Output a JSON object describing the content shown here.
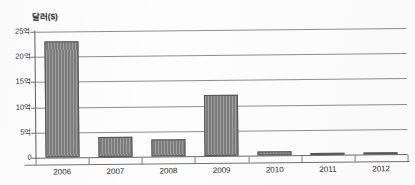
{
  "chart_data": {
    "type": "bar",
    "title": "",
    "ylabel": "달러($)",
    "xlabel": "",
    "categories": [
      "2006",
      "2007",
      "2008",
      "2009",
      "2010",
      "2011",
      "2012"
    ],
    "values": [
      23.0,
      4.0,
      3.3,
      12.1,
      0.7,
      0.2,
      0.1
    ],
    "unit": "억",
    "ylim": [
      0,
      25
    ],
    "yticks": [
      0,
      5,
      10,
      15,
      20,
      25
    ],
    "ytick_labels": [
      "0",
      "5억",
      "10억",
      "15억",
      "20억",
      "25억"
    ],
    "grid": "horizontal",
    "legend": "none",
    "bar_color": "#848484",
    "bar_edge_color": "#545454",
    "gridline_color": "#8d8d8d",
    "axis_color": "#5d5d5d",
    "background": "#ffffff"
  }
}
